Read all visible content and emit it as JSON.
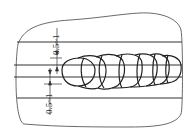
{
  "diagram": {
    "type": "weld-bead-ripple-diagram",
    "dimensions": [
      {
        "id": "top",
        "label": "0.5~1"
      },
      {
        "id": "bottom",
        "label": "0.5~1"
      }
    ],
    "colors": {
      "stroke": "#333333",
      "background": "#ffffff"
    }
  }
}
